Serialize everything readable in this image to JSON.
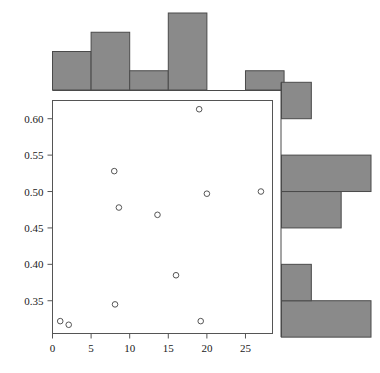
{
  "chart_data": {
    "type": "scatter",
    "title": "",
    "xlabel": "",
    "ylabel": "",
    "xlim": [
      0,
      28.5
    ],
    "ylim": [
      0.305,
      0.625
    ],
    "grid": false,
    "legend": null,
    "marker": {
      "shape": "circle-open",
      "edge_color": "#555555",
      "fill": "none",
      "size": 4
    },
    "x_ticks": [
      0,
      5,
      10,
      15,
      20,
      25
    ],
    "x_tick_labels": [
      "0",
      "5",
      "10",
      "15",
      "20",
      "25"
    ],
    "y_ticks": [
      0.35,
      0.4,
      0.45,
      0.5,
      0.55,
      0.6
    ],
    "y_tick_labels": [
      "0.35",
      "0.40",
      "0.45",
      "0.50",
      "0.55",
      "0.60"
    ],
    "points": [
      {
        "x": 1.0,
        "y": 0.322
      },
      {
        "x": 2.1,
        "y": 0.317
      },
      {
        "x": 8.0,
        "y": 0.528
      },
      {
        "x": 8.1,
        "y": 0.345
      },
      {
        "x": 8.6,
        "y": 0.478
      },
      {
        "x": 13.6,
        "y": 0.468
      },
      {
        "x": 16.0,
        "y": 0.385
      },
      {
        "x": 19.0,
        "y": 0.613
      },
      {
        "x": 19.2,
        "y": 0.322
      },
      {
        "x": 20.0,
        "y": 0.497
      },
      {
        "x": 27.0,
        "y": 0.5
      }
    ],
    "x_marginal_histogram": {
      "type": "bar",
      "orientation": "vertical",
      "bin_edges": [
        0,
        5,
        10,
        15,
        20,
        25,
        30
      ],
      "counts": [
        2,
        3,
        1,
        4,
        0,
        1
      ],
      "bar_fill": "#8a8a8a",
      "bar_edge": "#4a4a4a"
    },
    "y_marginal_histogram": {
      "type": "bar",
      "orientation": "horizontal",
      "bin_edges": [
        0.3,
        0.35,
        0.4,
        0.45,
        0.5,
        0.55,
        0.6,
        0.65
      ],
      "counts": [
        3,
        1,
        0,
        2,
        3,
        0,
        1
      ],
      "bar_fill": "#8a8a8a",
      "bar_edge": "#4a4a4a"
    }
  },
  "figure": {
    "background_color": "#ffffff",
    "frame_color": "#555555",
    "tick_color": "#555555",
    "text_color": "#1a1a1a"
  }
}
